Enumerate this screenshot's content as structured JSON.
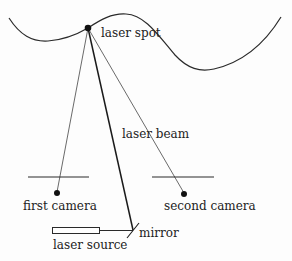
{
  "diagram": {
    "type": "laser triangulation setup",
    "labels": {
      "laser_spot": "laser spot",
      "laser_beam": "laser beam",
      "first_camera": "first camera",
      "second_camera": "second camera",
      "laser_source": "laser source",
      "mirror": "mirror"
    },
    "colors": {
      "line": "#2a2a2a",
      "background": "#fdfdfd"
    }
  }
}
